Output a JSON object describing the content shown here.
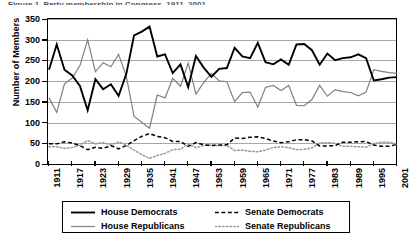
{
  "figure": {
    "caption_sliver": "Figure 1. Party membership in Congress, 1911–2001",
    "y_axis_title": "Number of Members"
  },
  "legend": {
    "position": "below-plot",
    "items": [
      {
        "name": "house-democrats",
        "label": "House Democrats",
        "color": "#000000",
        "style": "solid",
        "width": 1.9
      },
      {
        "name": "house-republicans",
        "label": "House Republicans",
        "color": "#808080",
        "style": "solid",
        "width": 1.2
      },
      {
        "name": "senate-democrats",
        "label": "Senate Democrats",
        "color": "#000000",
        "style": "dashed",
        "width": 1.5
      },
      {
        "name": "senate-republicans",
        "label": "Senate Republicans",
        "color": "#9a9a9a",
        "style": "dotted",
        "width": 1.5
      }
    ]
  },
  "chart_data": {
    "type": "line",
    "title": "",
    "xlabel": "",
    "ylabel": "Number of Members",
    "ylim": [
      0,
      350
    ],
    "yticks": [
      0,
      50,
      100,
      150,
      200,
      250,
      300,
      350
    ],
    "grid": true,
    "xlim": [
      1911,
      2001
    ],
    "xticks": [
      1911,
      1917,
      1923,
      1929,
      1935,
      1941,
      1947,
      1953,
      1959,
      1965,
      1971,
      1977,
      1983,
      1989,
      1995,
      2001
    ],
    "x": [
      1911,
      1913,
      1915,
      1917,
      1919,
      1921,
      1923,
      1925,
      1927,
      1929,
      1931,
      1933,
      1935,
      1937,
      1939,
      1941,
      1943,
      1945,
      1947,
      1949,
      1951,
      1953,
      1955,
      1957,
      1959,
      1961,
      1963,
      1965,
      1967,
      1969,
      1971,
      1973,
      1975,
      1977,
      1979,
      1981,
      1983,
      1985,
      1987,
      1989,
      1991,
      1993,
      1995,
      1997,
      1999,
      2001
    ],
    "series": [
      {
        "name": "House Democrats",
        "color": "#000000",
        "style": "solid",
        "values": [
          230,
          291,
          230,
          216,
          191,
          132,
          207,
          183,
          195,
          167,
          220,
          313,
          322,
          334,
          262,
          267,
          222,
          243,
          188,
          263,
          235,
          213,
          232,
          234,
          283,
          262,
          258,
          295,
          248,
          243,
          255,
          242,
          291,
          292,
          277,
          242,
          269,
          253,
          258,
          260,
          267,
          258,
          204,
          207,
          211,
          212
        ]
      },
      {
        "name": "House Republicans",
        "color": "#808080",
        "style": "solid",
        "values": [
          162,
          127,
          196,
          210,
          240,
          302,
          225,
          247,
          237,
          267,
          214,
          117,
          103,
          89,
          169,
          162,
          209,
          190,
          246,
          171,
          199,
          221,
          203,
          201,
          153,
          175,
          176,
          140,
          187,
          192,
          180,
          192,
          144,
          143,
          158,
          192,
          166,
          182,
          177,
          175,
          167,
          176,
          230,
          226,
          223,
          221
        ]
      },
      {
        "name": "Senate Democrats",
        "color": "#000000",
        "style": "dashed",
        "values": [
          51,
          51,
          56,
          53,
          47,
          37,
          43,
          40,
          47,
          39,
          47,
          59,
          69,
          76,
          69,
          66,
          57,
          57,
          45,
          54,
          49,
          47,
          48,
          49,
          65,
          64,
          67,
          68,
          64,
          58,
          54,
          56,
          61,
          61,
          58,
          46,
          46,
          47,
          55,
          55,
          56,
          57,
          48,
          45,
          45,
          50
        ]
      },
      {
        "name": "Senate Republicans",
        "color": "#9a9a9a",
        "style": "dotted",
        "values": [
          44,
          44,
          40,
          42,
          48,
          59,
          51,
          54,
          48,
          56,
          48,
          36,
          25,
          16,
          23,
          28,
          37,
          38,
          51,
          42,
          47,
          48,
          47,
          47,
          35,
          36,
          33,
          32,
          36,
          42,
          44,
          42,
          37,
          38,
          41,
          53,
          54,
          53,
          45,
          45,
          44,
          43,
          52,
          55,
          55,
          50
        ]
      }
    ]
  }
}
